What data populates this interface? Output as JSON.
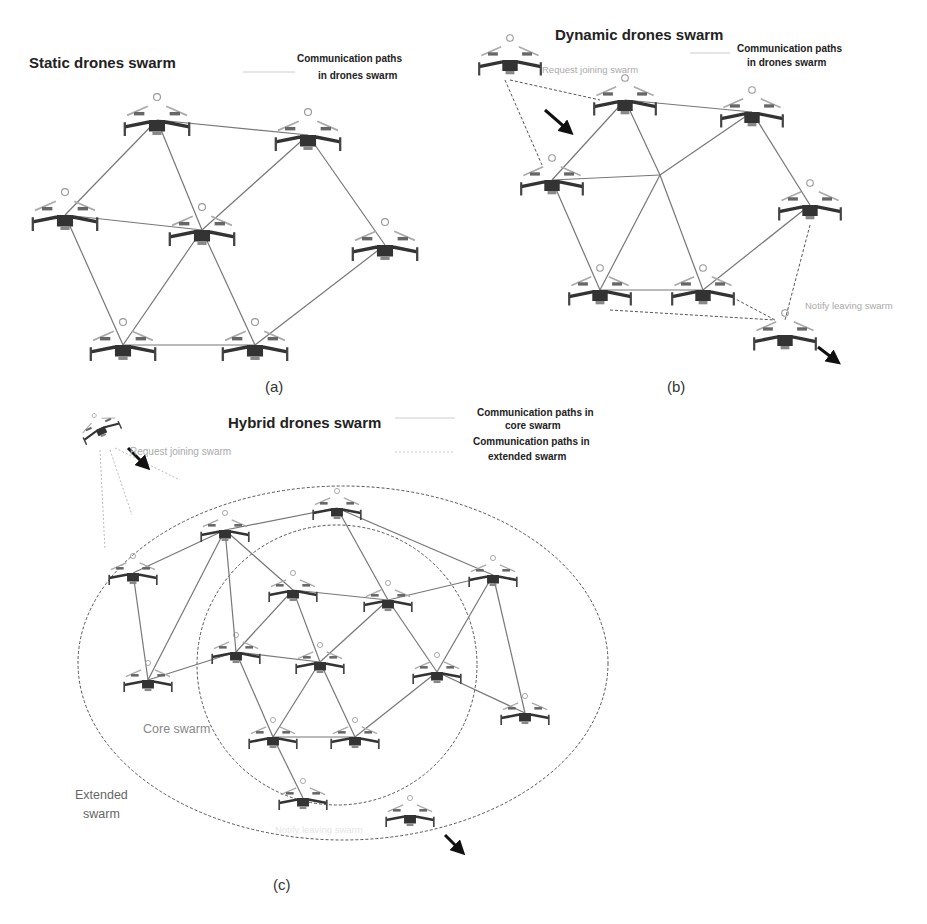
{
  "panels": {
    "a": {
      "title": "Static drones swarm",
      "legend_line1": "Communication paths",
      "legend_line2": "in drones swarm",
      "caption": "(a)",
      "nodes": [
        [
          157,
          120
        ],
        [
          308,
          135
        ],
        [
          65,
          215
        ],
        [
          202,
          230
        ],
        [
          385,
          245
        ],
        [
          123,
          345
        ],
        [
          255,
          345
        ]
      ],
      "edges": [
        [
          0,
          1
        ],
        [
          0,
          2
        ],
        [
          0,
          3
        ],
        [
          1,
          3
        ],
        [
          1,
          4
        ],
        [
          2,
          3
        ],
        [
          2,
          5
        ],
        [
          3,
          5
        ],
        [
          3,
          6
        ],
        [
          5,
          6
        ],
        [
          4,
          6
        ]
      ]
    },
    "b": {
      "title": "Dynamic drones swarm",
      "legend_line1": "Communication paths",
      "legend_line2": "in drones swarm",
      "caption": "(b)",
      "join_label": "Request joining swarm",
      "leave_label": "Notify leaving swarm",
      "nodes": [
        [
          625,
          100
        ],
        [
          752,
          112
        ],
        [
          552,
          180
        ],
        [
          810,
          205
        ],
        [
          600,
          290
        ],
        [
          703,
          290
        ]
      ],
      "ghost": [
        660,
        175
      ],
      "joining": [
        510,
        60
      ],
      "leaving": [
        785,
        335
      ],
      "edges": [
        [
          0,
          1
        ],
        [
          0,
          2
        ],
        [
          1,
          3
        ],
        [
          2,
          4
        ],
        [
          4,
          5
        ],
        [
          5,
          3
        ]
      ],
      "ghost_edges": [
        0,
        1,
        2,
        4,
        5
      ]
    },
    "c": {
      "title": "Hybrid drones swarm",
      "legend_core_1": "Communication paths in",
      "legend_core_2": "core swarm",
      "legend_ext_1": "Communication paths in",
      "legend_ext_2": "extended swarm",
      "join_label": "Request joining swarm",
      "leave_label": "Notify leaving swarm",
      "core_label": "Core swarm",
      "extended_label_1": "Extended",
      "extended_label_2": "swarm",
      "caption": "(c)",
      "nodes": [
        [
          225,
          530
        ],
        [
          337,
          508
        ],
        [
          133,
          573
        ],
        [
          493,
          575
        ],
        [
          293,
          590
        ],
        [
          388,
          600
        ],
        [
          236,
          652
        ],
        [
          320,
          662
        ],
        [
          148,
          680
        ],
        [
          437,
          672
        ],
        [
          525,
          713
        ],
        [
          273,
          737
        ],
        [
          355,
          737
        ],
        [
          303,
          798
        ],
        [
          410,
          815
        ]
      ],
      "edges": [
        [
          0,
          1
        ],
        [
          0,
          2
        ],
        [
          0,
          4
        ],
        [
          0,
          6
        ],
        [
          0,
          8
        ],
        [
          1,
          5
        ],
        [
          1,
          3
        ],
        [
          2,
          8
        ],
        [
          8,
          6
        ],
        [
          4,
          5
        ],
        [
          4,
          6
        ],
        [
          4,
          7
        ],
        [
          5,
          3
        ],
        [
          5,
          7
        ],
        [
          5,
          9
        ],
        [
          3,
          9
        ],
        [
          3,
          10
        ],
        [
          6,
          7
        ],
        [
          6,
          11
        ],
        [
          7,
          11
        ],
        [
          7,
          12
        ],
        [
          11,
          12
        ],
        [
          12,
          9
        ],
        [
          9,
          10
        ],
        [
          11,
          13
        ]
      ],
      "joining": [
        100,
        428
      ],
      "leaving_arrow": [
        435,
        830
      ]
    }
  }
}
